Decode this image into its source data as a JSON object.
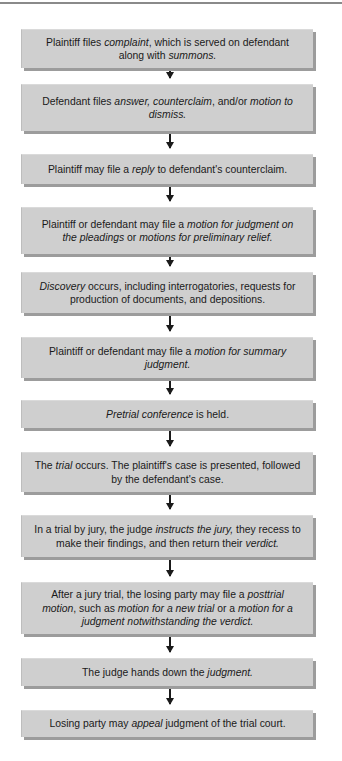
{
  "diagram": {
    "type": "flowchart",
    "orientation": "vertical",
    "colors": {
      "box_fill": "#cfcfcf",
      "box_shadow": "#9c9c9c",
      "arrow": "#1a1a1a",
      "top_rule": "#8a8a8a",
      "background": "#ffffff"
    },
    "steps": [
      {
        "segments": [
          {
            "t": "Plaintiff files ",
            "i": false
          },
          {
            "t": "complaint",
            "i": true
          },
          {
            "t": ", which is served on defendant along with ",
            "i": false
          },
          {
            "t": "summons.",
            "i": true
          }
        ]
      },
      {
        "segments": [
          {
            "t": "Defendant files ",
            "i": false
          },
          {
            "t": "answer, counterclaim",
            "i": true
          },
          {
            "t": ", and/or ",
            "i": false
          },
          {
            "t": "motion to dismiss.",
            "i": true
          }
        ]
      },
      {
        "segments": [
          {
            "t": "Plaintiff may file a ",
            "i": false
          },
          {
            "t": "reply",
            "i": true
          },
          {
            "t": " to defendant's counterclaim.",
            "i": false
          }
        ]
      },
      {
        "segments": [
          {
            "t": "Plaintiff or defendant may file a ",
            "i": false
          },
          {
            "t": "motion for judgment on the pleadings",
            "i": true
          },
          {
            "t": " or ",
            "i": false
          },
          {
            "t": "motions for preliminary relief.",
            "i": true
          }
        ]
      },
      {
        "segments": [
          {
            "t": "Discovery",
            "i": true
          },
          {
            "t": " occurs, including interrogatories, requests for production of documents, and depositions.",
            "i": false
          }
        ]
      },
      {
        "segments": [
          {
            "t": "Plaintiff or defendant may file a ",
            "i": false
          },
          {
            "t": "motion for summary judgment.",
            "i": true
          }
        ]
      },
      {
        "segments": [
          {
            "t": "Pretrial conference",
            "i": true
          },
          {
            "t": " is held.",
            "i": false
          }
        ]
      },
      {
        "segments": [
          {
            "t": "The ",
            "i": false
          },
          {
            "t": "trial",
            "i": true
          },
          {
            "t": " occurs.  The plaintiff's case is presented, followed by the defendant's case.",
            "i": false
          }
        ]
      },
      {
        "segments": [
          {
            "t": "In a trial by jury, the judge ",
            "i": false
          },
          {
            "t": "instructs the jury,",
            "i": true
          },
          {
            "t": " they recess to make their findings, and then return their ",
            "i": false
          },
          {
            "t": "verdict.",
            "i": true
          }
        ]
      },
      {
        "segments": [
          {
            "t": "After a jury trial, the losing party may file a ",
            "i": false
          },
          {
            "t": "posttrial motion",
            "i": true
          },
          {
            "t": ", such as ",
            "i": false
          },
          {
            "t": "motion for a new trial",
            "i": true
          },
          {
            "t": " or a ",
            "i": false
          },
          {
            "t": "motion for a judgment notwithstanding the verdict.",
            "i": true
          }
        ]
      },
      {
        "segments": [
          {
            "t": "The judge hands down the ",
            "i": false
          },
          {
            "t": "judgment.",
            "i": true
          }
        ]
      },
      {
        "segments": [
          {
            "t": "Losing party may ",
            "i": false
          },
          {
            "t": "appeal",
            "i": true
          },
          {
            "t": " judgment of the trial court.",
            "i": false
          }
        ]
      }
    ],
    "layout": {
      "box_tops": [
        29,
        84,
        154,
        207,
        272,
        337,
        400,
        452,
        515,
        582,
        658,
        710
      ],
      "box_heights": [
        39,
        47,
        30,
        47,
        41,
        41,
        28,
        40,
        42,
        52,
        28,
        27
      ]
    }
  }
}
